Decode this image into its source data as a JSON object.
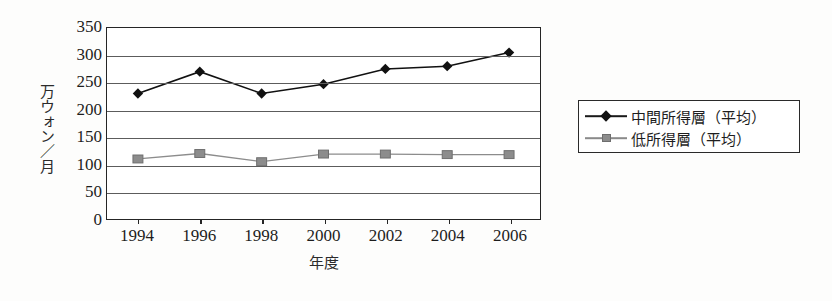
{
  "chart_data": {
    "type": "line",
    "title": "",
    "xlabel": "年度",
    "ylabel": "万ウォン／月",
    "categories": [
      "1994",
      "1996",
      "1998",
      "2000",
      "2002",
      "2004",
      "2006"
    ],
    "x_tick_labels": [
      "1994",
      "1996",
      "1998",
      "2000",
      "2002",
      "2004",
      "2006"
    ],
    "y_tick_labels": [
      "350",
      "300",
      "250",
      "200",
      "150",
      "100",
      "50",
      "0"
    ],
    "y_ticks": [
      350,
      300,
      250,
      200,
      150,
      100,
      50,
      0
    ],
    "ylim": [
      0,
      350
    ],
    "grid": true,
    "legend_position": "right",
    "series": [
      {
        "name": "中間所得層（平均）",
        "marker": "diamond",
        "color": "#111111",
        "values": [
          230,
          270,
          230,
          247,
          275,
          280,
          305
        ]
      },
      {
        "name": "低所得層（平均）",
        "marker": "square",
        "color": "#8c8c8c",
        "values": [
          110,
          120,
          105,
          119,
          119,
          118,
          118
        ]
      }
    ]
  },
  "legend": {
    "items": [
      {
        "label": "中間所得層（平均）",
        "marker": "diamond"
      },
      {
        "label": "低所得層（平均）",
        "marker": "square"
      }
    ]
  },
  "axes": {
    "y_title": "万ウォン／月",
    "x_title": "年度"
  }
}
